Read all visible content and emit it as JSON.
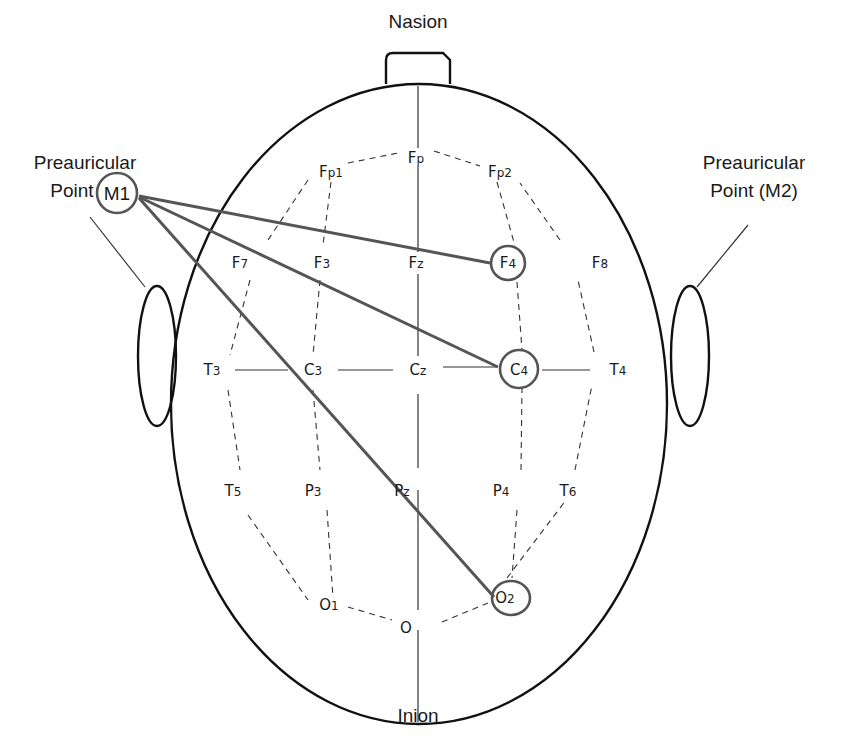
{
  "diagram": {
    "landmarks": {
      "top": "Nasion",
      "bottom": "Inion",
      "left_line1": "Preauricular",
      "left_line2": "Point",
      "left_ref": "M1",
      "right_line1": "Preauricular",
      "right_line2": "Point (M2)"
    },
    "electrodes": {
      "fp": {
        "main": "F",
        "sub": "p"
      },
      "fp1": {
        "main": "F",
        "sub": "p1"
      },
      "fp2": {
        "main": "F",
        "sub": "p2"
      },
      "f7": {
        "main": "F",
        "sub": "7"
      },
      "f3": {
        "main": "F",
        "sub": "3"
      },
      "fz": {
        "main": "F",
        "sub": "z"
      },
      "f4": {
        "main": "F",
        "sub": "4"
      },
      "f8": {
        "main": "F",
        "sub": "8"
      },
      "t3": {
        "main": "T",
        "sub": "3"
      },
      "c3": {
        "main": "C",
        "sub": "3"
      },
      "cz": {
        "main": "C",
        "sub": "z"
      },
      "c4": {
        "main": "C",
        "sub": "4"
      },
      "t4": {
        "main": "T",
        "sub": "4"
      },
      "t5": {
        "main": "T",
        "sub": "5"
      },
      "p3": {
        "main": "P",
        "sub": "3"
      },
      "pz": {
        "main": "P",
        "sub": "z"
      },
      "p4": {
        "main": "P",
        "sub": "4"
      },
      "t6": {
        "main": "T",
        "sub": "6"
      },
      "o1": {
        "main": "O",
        "sub": "1"
      },
      "o": {
        "main": "O",
        "sub": ""
      },
      "o2": {
        "main": "O",
        "sub": "2"
      }
    },
    "highlighted": [
      "M1",
      "F4",
      "C4",
      "O2"
    ],
    "connections": [
      {
        "from": "M1",
        "to": "F4"
      },
      {
        "from": "M1",
        "to": "C4"
      },
      {
        "from": "M1",
        "to": "O2"
      }
    ],
    "colors": {
      "outline": "#111111",
      "connection": "#555555",
      "grid": "#333333"
    }
  }
}
